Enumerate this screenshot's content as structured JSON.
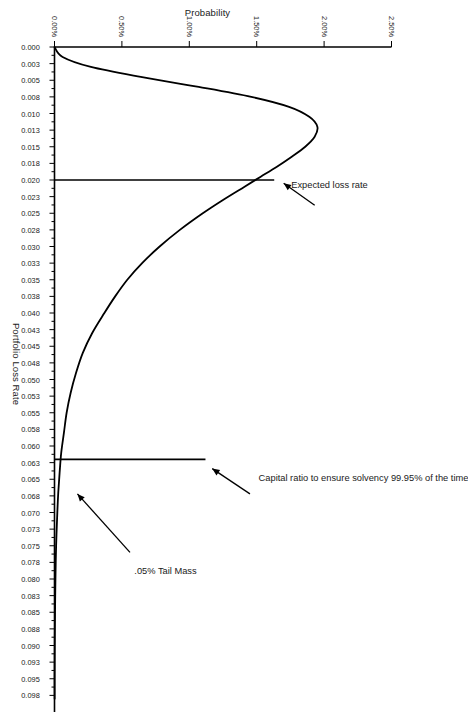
{
  "chart_data": {
    "type": "line",
    "title": "",
    "xlabel": "Portfolio Loss Rate",
    "ylabel": "Probability",
    "xlim": [
      0.0,
      0.1
    ],
    "ylim": [
      0.0,
      2.5
    ],
    "grid": false,
    "legend": "none",
    "orientation": "rotated-90-clockwise",
    "xticks": [
      "0.000",
      "0.003",
      "0.005",
      "0.008",
      "0.010",
      "0.013",
      "0.015",
      "0.018",
      "0.020",
      "0.023",
      "0.025",
      "0.028",
      "0.030",
      "0.033",
      "0.035",
      "0.038",
      "0.040",
      "0.043",
      "0.045",
      "0.048",
      "0.050",
      "0.053",
      "0.055",
      "0.058",
      "0.060",
      "0.063",
      "0.065",
      "0.068",
      "0.070",
      "0.073",
      "0.075",
      "0.078",
      "0.080",
      "0.083",
      "0.085",
      "0.088",
      "0.090",
      "0.093",
      "0.095",
      "0.098"
    ],
    "xtick_values": [
      0.0,
      0.0025,
      0.005,
      0.0075,
      0.01,
      0.0125,
      0.015,
      0.0175,
      0.02,
      0.0225,
      0.025,
      0.0275,
      0.03,
      0.0325,
      0.035,
      0.0375,
      0.04,
      0.0425,
      0.045,
      0.0475,
      0.05,
      0.0525,
      0.055,
      0.0575,
      0.06,
      0.0625,
      0.065,
      0.0675,
      0.07,
      0.0725,
      0.075,
      0.0775,
      0.08,
      0.0825,
      0.085,
      0.0875,
      0.09,
      0.0925,
      0.095,
      0.0975
    ],
    "yticks": [
      "0.00%",
      "0.50%",
      "1.00%",
      "1.50%",
      "2.00%",
      "2.50%"
    ],
    "ytick_values": [
      0.0,
      0.5,
      1.0,
      1.5,
      2.0,
      2.5
    ],
    "series": [
      {
        "name": "Loss distribution",
        "color": "#000000",
        "x": [
          0.0,
          0.0015,
          0.003,
          0.0045,
          0.006,
          0.0075,
          0.009,
          0.0105,
          0.012,
          0.0135,
          0.015,
          0.0165,
          0.018,
          0.0195,
          0.021,
          0.023,
          0.025,
          0.0275,
          0.03,
          0.0325,
          0.035,
          0.0375,
          0.04,
          0.043,
          0.046,
          0.049,
          0.052,
          0.055,
          0.058,
          0.061,
          0.064,
          0.067,
          0.07,
          0.075,
          0.08,
          0.085,
          0.09,
          0.095,
          0.098
        ],
        "y": [
          0.0,
          0.06,
          0.27,
          0.64,
          1.07,
          1.46,
          1.74,
          1.89,
          1.95,
          1.93,
          1.86,
          1.76,
          1.65,
          1.53,
          1.41,
          1.25,
          1.1,
          0.93,
          0.78,
          0.65,
          0.54,
          0.45,
          0.37,
          0.28,
          0.21,
          0.16,
          0.12,
          0.09,
          0.07,
          0.05,
          0.038,
          0.028,
          0.021,
          0.012,
          0.007,
          0.004,
          0.002,
          0.001,
          0.001
        ]
      }
    ],
    "markers": [
      {
        "name": "expected-loss-line",
        "kind": "vertical-line",
        "x": 0.02,
        "y_from": 0.0,
        "y_to": 1.63,
        "color": "#000000"
      },
      {
        "name": "capital-ratio-line",
        "kind": "vertical-line",
        "x": 0.062,
        "y_from": 0.0,
        "y_to": 1.12,
        "color": "#000000"
      }
    ],
    "annotations": [
      {
        "name": "expected-loss-annotation",
        "text": "Expected loss rate",
        "target_x": 0.02,
        "target_y": 1.63
      },
      {
        "name": "capital-ratio-annotation",
        "text": "Capital ratio to ensure solvency 99.95% of the time",
        "target_x": 0.062,
        "target_y": 1.12
      },
      {
        "name": "tail-mass-annotation",
        "text": ".05% Tail Mass",
        "target_x": 0.064,
        "target_y": 0.1
      }
    ]
  },
  "axes": {
    "x_title": "Portfolio Loss Rate",
    "y_title": "Probability"
  },
  "annotations": {
    "expected_loss": "Expected loss rate",
    "capital_ratio": "Capital ratio to ensure solvency 99.95% of the time",
    "tail_mass": ".05% Tail Mass"
  },
  "caption": {
    "faint_text": ""
  }
}
